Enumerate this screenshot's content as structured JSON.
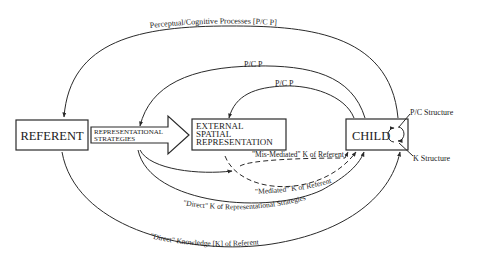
{
  "nodes": {
    "referent": "REFERENT",
    "external_line1": "EXTERNAL",
    "external_line2": "SPATIAL",
    "external_line3": "REPRESENTATION",
    "child": "CHILD"
  },
  "arrow": {
    "line1": "REPRESENTATIONAL",
    "line2": "STRATEGIES"
  },
  "labels": {
    "outer_top": "Perceptual/Cognitive Processes [P/C P]",
    "middle_top": "P/C P",
    "inner_top": "P/C P",
    "pc_structure": "P/C Structure",
    "k_structure": "K Structure",
    "mis_mediated": "\"Mis-Mediated\" K of Referent",
    "mediated": "\"Mediated\" K of Referent",
    "direct_strategies": "\"Direct\" K of Representational Strategies",
    "direct_knowledge": "\"Direct\" Knowledge [K] of Referent"
  }
}
